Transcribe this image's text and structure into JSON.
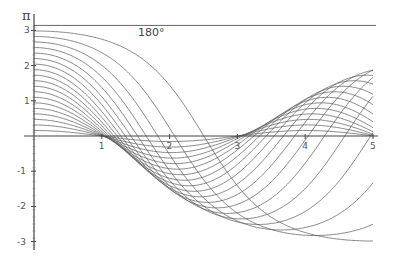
{
  "chart_data": {
    "type": "line",
    "title": "",
    "annotation": "180°",
    "xlabel": "",
    "ylabel": "π",
    "xlim": [
      0,
      5
    ],
    "ylim": [
      -3.14159,
      3.14159
    ],
    "x_ticks": [
      1,
      2,
      3,
      4,
      5
    ],
    "y_ticks": [
      3,
      2,
      1,
      -1,
      -2,
      -3
    ],
    "grid": false,
    "legend": "none",
    "model": {
      "equation": "θ'' = -(π/2)^2 sin θ",
      "omega0": 1.5707963,
      "theta_dot0": 0
    },
    "series_amplitudes_deg": [
      9,
      18,
      27,
      36,
      45,
      54,
      63,
      72,
      81,
      90,
      99,
      108,
      117,
      126,
      135,
      144,
      153,
      162,
      171
    ],
    "reference_line": {
      "y": 3.14159,
      "label": "180°"
    },
    "line_color": "#555555"
  },
  "axes": {
    "y_axis_symbol": "π",
    "x_tick_labels": [
      "1",
      "2",
      "3",
      "4",
      "5"
    ],
    "y_tick_labels": [
      "3",
      "2",
      "1",
      "-1",
      "-2",
      "-3"
    ]
  }
}
